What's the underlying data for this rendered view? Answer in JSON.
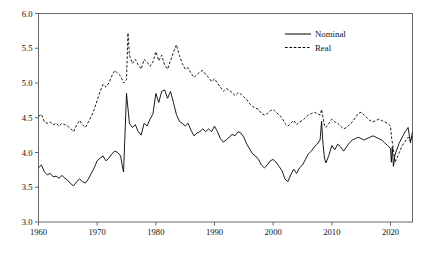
{
  "chart_data": {
    "type": "line",
    "title": "",
    "subtitle": "",
    "xlabel": "",
    "ylabel": "",
    "xlim": [
      1960,
      2023.75
    ],
    "ylim": [
      3.0,
      6.0
    ],
    "grid": false,
    "legend_position": "top-right",
    "xticks": [
      1960,
      1970,
      1980,
      1990,
      2000,
      2010,
      2020
    ],
    "xtick_labels": [
      "1960",
      "1970",
      "1980",
      "1990",
      "2000",
      "2010",
      "2020"
    ],
    "yticks": [
      3.0,
      3.5,
      4.0,
      4.5,
      5.0,
      5.5,
      6.0
    ],
    "ytick_labels": [
      "3.0",
      "3.5",
      "4.0",
      "4.5",
      "5.0",
      "5.5",
      "6.0"
    ],
    "series": [
      {
        "name": "Nominal",
        "style": "solid",
        "color": "#000000",
        "x": [
          1960.0,
          1960.5,
          1961.0,
          1961.5,
          1962.0,
          1962.5,
          1963.0,
          1963.5,
          1964.0,
          1964.5,
          1965.0,
          1965.5,
          1966.0,
          1966.5,
          1967.0,
          1967.5,
          1968.0,
          1968.5,
          1969.0,
          1969.5,
          1970.0,
          1970.5,
          1971.0,
          1971.5,
          1972.0,
          1972.5,
          1973.0,
          1973.5,
          1974.0,
          1974.25,
          1974.5,
          1975.0,
          1975.5,
          1976.0,
          1976.5,
          1977.0,
          1977.5,
          1978.0,
          1978.5,
          1979.0,
          1979.5,
          1980.0,
          1980.5,
          1981.0,
          1981.5,
          1982.0,
          1982.5,
          1983.0,
          1983.5,
          1984.0,
          1984.5,
          1985.0,
          1985.5,
          1986.0,
          1986.5,
          1987.0,
          1987.5,
          1988.0,
          1988.5,
          1989.0,
          1989.5,
          1990.0,
          1990.5,
          1991.0,
          1991.5,
          1992.0,
          1992.5,
          1993.0,
          1993.5,
          1994.0,
          1994.5,
          1995.0,
          1995.5,
          1996.0,
          1996.5,
          1997.0,
          1997.5,
          1998.0,
          1998.5,
          1999.0,
          1999.5,
          2000.0,
          2000.5,
          2001.0,
          2001.5,
          2002.0,
          2002.5,
          2003.0,
          2003.5,
          2004.0,
          2004.5,
          2005.0,
          2005.5,
          2006.0,
          2006.5,
          2007.0,
          2007.5,
          2008.0,
          2008.25,
          2008.5,
          2008.75,
          2009.0,
          2009.5,
          2010.0,
          2010.5,
          2011.0,
          2011.5,
          2012.0,
          2012.5,
          2013.0,
          2013.5,
          2014.0,
          2014.5,
          2015.0,
          2015.5,
          2016.0,
          2016.5,
          2017.0,
          2017.5,
          2018.0,
          2018.5,
          2019.0,
          2019.5,
          2020.0,
          2020.15,
          2020.3,
          2020.5,
          2020.75,
          2021.0,
          2021.5,
          2022.0,
          2022.5,
          2023.0,
          2023.4,
          2023.75
        ],
        "y": [
          3.78,
          3.82,
          3.72,
          3.68,
          3.7,
          3.65,
          3.66,
          3.63,
          3.67,
          3.63,
          3.6,
          3.55,
          3.52,
          3.58,
          3.62,
          3.58,
          3.56,
          3.62,
          3.7,
          3.78,
          3.88,
          3.92,
          3.95,
          3.88,
          3.92,
          3.98,
          4.02,
          4.0,
          3.95,
          3.82,
          3.72,
          4.85,
          4.42,
          4.36,
          4.4,
          4.3,
          4.25,
          4.42,
          4.38,
          4.48,
          4.55,
          4.85,
          4.72,
          4.88,
          4.9,
          4.78,
          4.88,
          4.72,
          4.55,
          4.45,
          4.42,
          4.38,
          4.42,
          4.32,
          4.24,
          4.28,
          4.3,
          4.34,
          4.3,
          4.34,
          4.3,
          4.38,
          4.3,
          4.2,
          4.15,
          4.18,
          4.22,
          4.26,
          4.24,
          4.3,
          4.28,
          4.22,
          4.12,
          4.05,
          3.98,
          3.95,
          3.9,
          3.82,
          3.78,
          3.82,
          3.88,
          3.9,
          3.86,
          3.8,
          3.74,
          3.62,
          3.58,
          3.68,
          3.76,
          3.7,
          3.78,
          3.82,
          3.9,
          3.98,
          4.02,
          4.08,
          4.12,
          4.18,
          4.45,
          4.12,
          3.92,
          3.85,
          3.96,
          4.1,
          4.04,
          4.12,
          4.08,
          4.02,
          4.08,
          4.14,
          4.18,
          4.2,
          4.22,
          4.2,
          4.18,
          4.2,
          4.22,
          4.24,
          4.22,
          4.2,
          4.18,
          4.14,
          4.1,
          4.06,
          3.86,
          4.08,
          3.8,
          3.96,
          4.02,
          4.14,
          4.22,
          4.3,
          4.36,
          4.14,
          4.3
        ]
      },
      {
        "name": "Real",
        "style": "dashed",
        "color": "#000000",
        "x": [
          1960.0,
          1960.5,
          1961.0,
          1961.5,
          1962.0,
          1962.5,
          1963.0,
          1963.5,
          1964.0,
          1964.5,
          1965.0,
          1965.5,
          1966.0,
          1966.5,
          1967.0,
          1967.5,
          1968.0,
          1968.5,
          1969.0,
          1969.5,
          1970.0,
          1970.5,
          1971.0,
          1971.5,
          1972.0,
          1972.5,
          1973.0,
          1973.5,
          1974.0,
          1974.5,
          1975.0,
          1975.25,
          1975.5,
          1976.0,
          1976.5,
          1977.0,
          1977.5,
          1978.0,
          1978.5,
          1979.0,
          1979.5,
          1980.0,
          1980.5,
          1981.0,
          1981.5,
          1982.0,
          1982.5,
          1983.0,
          1983.5,
          1984.0,
          1984.5,
          1985.0,
          1985.5,
          1986.0,
          1986.5,
          1987.0,
          1987.5,
          1988.0,
          1988.5,
          1989.0,
          1989.5,
          1990.0,
          1990.5,
          1991.0,
          1991.5,
          1992.0,
          1992.5,
          1993.0,
          1993.5,
          1994.0,
          1994.5,
          1995.0,
          1995.5,
          1996.0,
          1996.5,
          1997.0,
          1997.5,
          1998.0,
          1998.5,
          1999.0,
          1999.5,
          2000.0,
          2000.5,
          2001.0,
          2001.5,
          2002.0,
          2002.5,
          2003.0,
          2003.5,
          2004.0,
          2004.5,
          2005.0,
          2005.5,
          2006.0,
          2006.5,
          2007.0,
          2007.5,
          2008.0,
          2008.25,
          2008.5,
          2008.75,
          2009.0,
          2009.5,
          2010.0,
          2010.5,
          2011.0,
          2011.5,
          2012.0,
          2012.5,
          2013.0,
          2013.5,
          2014.0,
          2014.5,
          2015.0,
          2015.5,
          2016.0,
          2016.5,
          2017.0,
          2017.5,
          2018.0,
          2018.5,
          2019.0,
          2019.5,
          2020.0,
          2020.2,
          2020.4,
          2020.6,
          2020.8,
          2021.0,
          2021.5,
          2022.0,
          2022.5,
          2023.0,
          2023.4,
          2023.75
        ],
        "y": [
          4.52,
          4.55,
          4.44,
          4.42,
          4.44,
          4.4,
          4.42,
          4.38,
          4.42,
          4.4,
          4.38,
          4.34,
          4.3,
          4.4,
          4.46,
          4.4,
          4.36,
          4.44,
          4.52,
          4.62,
          4.75,
          4.88,
          4.98,
          4.94,
          5.0,
          5.1,
          5.18,
          5.14,
          5.1,
          5.0,
          5.05,
          5.72,
          5.4,
          5.28,
          5.34,
          5.26,
          5.2,
          5.34,
          5.3,
          5.24,
          5.3,
          5.45,
          5.32,
          5.4,
          5.26,
          5.2,
          5.32,
          5.44,
          5.55,
          5.4,
          5.28,
          5.2,
          5.22,
          5.14,
          5.08,
          5.12,
          5.16,
          5.18,
          5.12,
          5.08,
          5.02,
          5.06,
          5.0,
          4.94,
          4.88,
          4.92,
          4.9,
          4.86,
          4.82,
          4.86,
          4.84,
          4.8,
          4.76,
          4.7,
          4.66,
          4.64,
          4.62,
          4.56,
          4.54,
          4.56,
          4.6,
          4.62,
          4.58,
          4.54,
          4.5,
          4.42,
          4.38,
          4.42,
          4.46,
          4.4,
          4.44,
          4.46,
          4.5,
          4.54,
          4.56,
          4.58,
          4.56,
          4.54,
          4.62,
          4.5,
          4.38,
          4.36,
          4.42,
          4.48,
          4.44,
          4.42,
          4.38,
          4.34,
          4.36,
          4.4,
          4.44,
          4.5,
          4.56,
          4.58,
          4.54,
          4.5,
          4.46,
          4.44,
          4.46,
          4.48,
          4.46,
          4.44,
          4.42,
          4.38,
          4.2,
          4.1,
          3.98,
          3.86,
          3.9,
          4.0,
          4.1,
          4.16,
          4.22,
          4.16,
          4.24
        ]
      }
    ],
    "annotations": []
  },
  "legend": {
    "items": [
      {
        "label": "Nominal",
        "style": "solid"
      },
      {
        "label": "Real",
        "style": "dashed"
      }
    ]
  },
  "axes": {
    "frame_color": "#555555"
  }
}
